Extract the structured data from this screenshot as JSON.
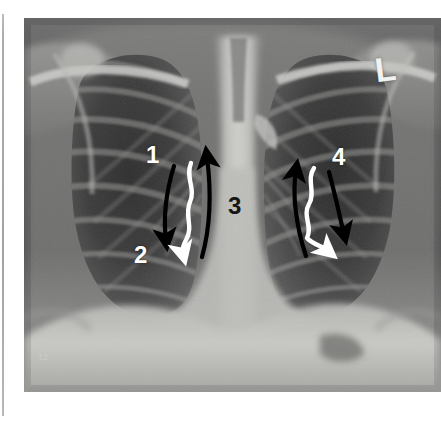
{
  "figure": {
    "type": "chest-radiograph",
    "view": "PA (posteroanterior) chest X-ray",
    "background_color": "#ffffff",
    "plate_rect": {
      "x": 24,
      "y": 18,
      "width": 417,
      "height": 374
    }
  },
  "markers": {
    "side_marker": "L",
    "side_marker_meaning": "left side marker",
    "corner_stamp": "12"
  },
  "annotations": {
    "labels": [
      {
        "id": "1",
        "text": "1",
        "color": "#ffffff",
        "x": 146,
        "y": 143
      },
      {
        "id": "2",
        "text": "2",
        "color": "#ffffff",
        "x": 134,
        "y": 243
      },
      {
        "id": "3",
        "text": "3",
        "color": "#151515",
        "x": 228,
        "y": 194
      },
      {
        "id": "4",
        "text": "4",
        "color": "#ffffff",
        "x": 332,
        "y": 145
      }
    ],
    "arrows": [
      {
        "id": "right-lung-black-down",
        "style": "curved",
        "color": "#000000",
        "direction": "down",
        "side": "image-left"
      },
      {
        "id": "right-lung-white-wavy-down",
        "style": "wavy",
        "color": "#ffffff",
        "direction": "down",
        "side": "image-left"
      },
      {
        "id": "right-lung-black-up",
        "style": "curved",
        "color": "#000000",
        "direction": "up",
        "side": "image-left"
      },
      {
        "id": "left-lung-black-up",
        "style": "curved",
        "color": "#000000",
        "direction": "up",
        "side": "image-right"
      },
      {
        "id": "left-lung-white-wavy-down",
        "style": "wavy",
        "color": "#ffffff",
        "direction": "down",
        "side": "image-right"
      },
      {
        "id": "left-lung-black-down",
        "style": "curved",
        "color": "#000000",
        "direction": "down",
        "side": "image-right"
      }
    ]
  },
  "colors": {
    "page_background": "#ffffff",
    "page_edge_line": "#a8a8a8",
    "lung_field_dark": "#3a3a3a",
    "soft_tissue_mid": "#8a8a8a",
    "bone_bright": "#d8d8d6",
    "mediastinum": "#c9c9c7",
    "annotation_white": "#ffffff",
    "annotation_black": "#000000"
  }
}
